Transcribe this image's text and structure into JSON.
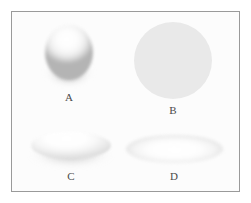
{
  "figure": {
    "background_color": "#fcfcfc",
    "outer_background_color": "#ffffff",
    "border_color": "#9a9a9a",
    "label_color": "#4a4a4a",
    "panels": [
      {
        "label": "A",
        "shape_name": "sphere",
        "description": "Shaded three-dimensional sphere with bright highlight at upper left and dark shading along the lower edge",
        "fill_highlight_color": "#ffffff",
        "fill_shadow_color": "#b4b4b4",
        "position": "top-left"
      },
      {
        "label": "B",
        "shape_name": "circle",
        "description": "Flat uniform light gray circle with no shading",
        "fill_color": "#e9e9e9",
        "position": "top-right"
      },
      {
        "label": "C",
        "shape_name": "oblate-disc",
        "description": "Flattened three-dimensional ellipsoid disc with bright top surface and shaded underside rim",
        "fill_highlight_color": "#ffffff",
        "fill_shadow_color": "#e0e0e0",
        "position": "bottom-left"
      },
      {
        "label": "D",
        "shape_name": "ellipse",
        "description": "Wide flat ellipse with soft gray rim and white center",
        "fill_highlight_color": "#ffffff",
        "fill_shadow_color": "#dcdcdc",
        "position": "bottom-right"
      }
    ]
  }
}
